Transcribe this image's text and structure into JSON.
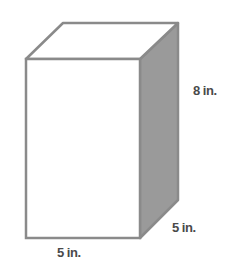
{
  "figure": {
    "type": "rectangular prism",
    "labels": {
      "height": "8 in.",
      "depth": "5 in.",
      "width": "5 in."
    },
    "colors": {
      "edge": "#8a8a8a",
      "front_face": "#ffffff",
      "top_face": "#ffffff",
      "side_face": "#9a9a9a"
    }
  }
}
